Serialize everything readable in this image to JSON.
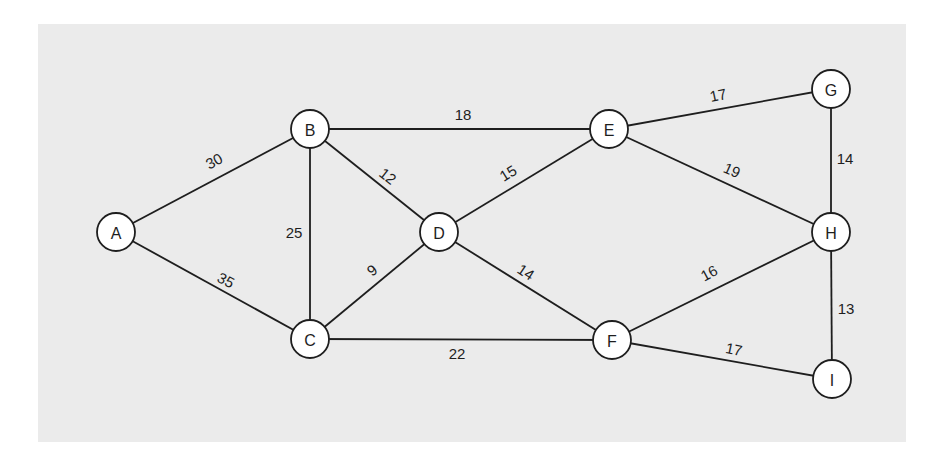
{
  "diagram": {
    "type": "weighted-undirected-graph",
    "background_color": "#ebebeb",
    "stroke_color": "#1e1e1e",
    "node_fill": "#ffffff",
    "node_radius": 19,
    "nodes": [
      {
        "id": "A",
        "label": "A",
        "x": 116,
        "y": 232
      },
      {
        "id": "B",
        "label": "B",
        "x": 310,
        "y": 129
      },
      {
        "id": "C",
        "label": "C",
        "x": 310,
        "y": 339
      },
      {
        "id": "D",
        "label": "D",
        "x": 439,
        "y": 232
      },
      {
        "id": "E",
        "label": "E",
        "x": 609,
        "y": 129
      },
      {
        "id": "F",
        "label": "F",
        "x": 612,
        "y": 340
      },
      {
        "id": "G",
        "label": "G",
        "x": 831,
        "y": 89
      },
      {
        "id": "H",
        "label": "H",
        "x": 831,
        "y": 232
      },
      {
        "id": "I",
        "label": "I",
        "x": 832,
        "y": 379
      }
    ],
    "edges": [
      {
        "from": "A",
        "to": "B",
        "weight": "30",
        "label_x": 214,
        "label_y": 161,
        "angle": -28
      },
      {
        "from": "A",
        "to": "C",
        "weight": "35",
        "label_x": 226,
        "label_y": 280,
        "angle": 28
      },
      {
        "from": "B",
        "to": "C",
        "weight": "25",
        "label_x": 294,
        "label_y": 232,
        "angle": 0
      },
      {
        "from": "B",
        "to": "D",
        "weight": "12",
        "label_x": 388,
        "label_y": 176,
        "angle": 38
      },
      {
        "from": "B",
        "to": "E",
        "weight": "18",
        "label_x": 463,
        "label_y": 114,
        "angle": 0
      },
      {
        "from": "C",
        "to": "D",
        "weight": "9",
        "label_x": 372,
        "label_y": 270,
        "angle": -38
      },
      {
        "from": "C",
        "to": "F",
        "weight": "22",
        "label_x": 457,
        "label_y": 353,
        "angle": 0
      },
      {
        "from": "D",
        "to": "E",
        "weight": "15",
        "label_x": 508,
        "label_y": 173,
        "angle": -32
      },
      {
        "from": "D",
        "to": "F",
        "weight": "14",
        "label_x": 526,
        "label_y": 272,
        "angle": 33
      },
      {
        "from": "E",
        "to": "G",
        "weight": "17",
        "label_x": 718,
        "label_y": 95,
        "angle": -12
      },
      {
        "from": "E",
        "to": "H",
        "weight": "19",
        "label_x": 732,
        "label_y": 170,
        "angle": 24
      },
      {
        "from": "G",
        "to": "H",
        "weight": "14",
        "label_x": 845,
        "label_y": 158,
        "angle": 0
      },
      {
        "from": "F",
        "to": "H",
        "weight": "16",
        "label_x": 709,
        "label_y": 273,
        "angle": -28
      },
      {
        "from": "F",
        "to": "I",
        "weight": "17",
        "label_x": 734,
        "label_y": 349,
        "angle": 12
      },
      {
        "from": "H",
        "to": "I",
        "weight": "13",
        "label_x": 846,
        "label_y": 308,
        "angle": 0
      }
    ]
  }
}
